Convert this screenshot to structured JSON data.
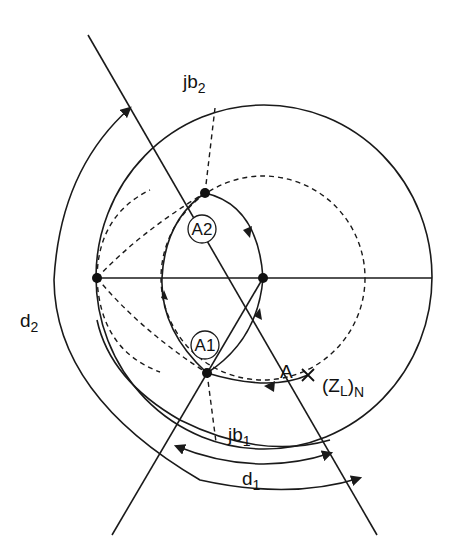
{
  "diagram": {
    "type": "smith-chart-matching",
    "labels": {
      "jb2": {
        "main": "jb",
        "sub": "2"
      },
      "jb1": {
        "main": "jb",
        "sub": "1"
      },
      "d1": {
        "main": "d",
        "sub": "1"
      },
      "d2": {
        "main": "d",
        "sub": "2"
      },
      "a": "A",
      "zl": {
        "open": "(Z",
        "sub": "L",
        "close": ")",
        "sub2": "N"
      },
      "a1": "A1",
      "a2": "A2"
    },
    "points": [
      "A2",
      "A1",
      "A",
      "center",
      "left-short-point"
    ],
    "colors": {
      "stroke": "#1a1a1a",
      "background": "#ffffff"
    }
  }
}
